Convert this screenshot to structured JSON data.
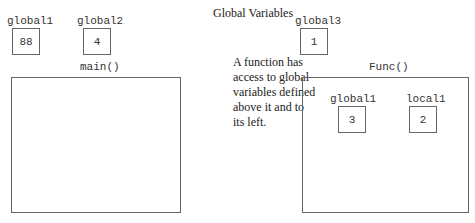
{
  "title": "Global Variables",
  "note": "A function has access to global variables defined above it and to its left.",
  "note_lines": [
    "A function has",
    "access to global",
    "variables defined",
    "above it and to",
    "its left."
  ],
  "globals": [
    {
      "name": "global1",
      "value": "88"
    },
    {
      "name": "global2",
      "value": "4"
    },
    {
      "name": "global3",
      "value": "1"
    }
  ],
  "functions": [
    {
      "name": "main()",
      "variables": []
    },
    {
      "name": "Func()",
      "variables": [
        {
          "name": "global1",
          "value": "3"
        },
        {
          "name": "local1",
          "value": "2"
        }
      ]
    }
  ]
}
